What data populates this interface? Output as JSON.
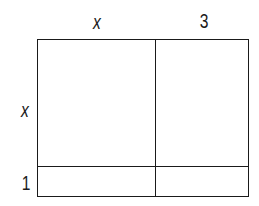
{
  "diagram": {
    "type": "area-model",
    "top_labels": [
      {
        "text": "x",
        "italic": true
      },
      {
        "text": "3",
        "italic": false
      }
    ],
    "side_labels": [
      {
        "text": "x",
        "italic": true
      },
      {
        "text": "1",
        "italic": false
      }
    ],
    "regions": [
      {
        "row": "x",
        "col": "x",
        "content": ""
      },
      {
        "row": "x",
        "col": "3",
        "content": ""
      },
      {
        "row": "1",
        "col": "x",
        "content": ""
      },
      {
        "row": "1",
        "col": "3",
        "content": ""
      }
    ],
    "line_color": "#1a1a1a",
    "background": "#ffffff"
  }
}
